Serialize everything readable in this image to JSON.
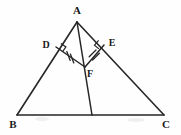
{
  "figure": {
    "type": "geometry-diagram",
    "canvas": {
      "width": 181,
      "height": 135
    },
    "background_color": "#fefefe",
    "stroke_color": "#262626",
    "label_color": "#1a1a1a"
  },
  "labels": {
    "a": "A",
    "b": "B",
    "c": "C",
    "d": "D",
    "e": "E",
    "f": "F"
  },
  "points": {
    "A": {
      "x": 77,
      "y": 22
    },
    "B": {
      "x": 17,
      "y": 115
    },
    "C": {
      "x": 164,
      "y": 115
    },
    "D": {
      "x": 56,
      "y": 47
    },
    "E": {
      "x": 104,
      "y": 45
    },
    "F": {
      "x": 85,
      "y": 67
    },
    "G": {
      "x": 92,
      "y": 115
    }
  },
  "label_positions": {
    "A": {
      "x": 77,
      "y": 14
    },
    "B": {
      "x": 13,
      "y": 128
    },
    "C": {
      "x": 166,
      "y": 128
    },
    "D": {
      "x": 46,
      "y": 48
    },
    "E": {
      "x": 112,
      "y": 46
    },
    "F": {
      "x": 90,
      "y": 76
    }
  },
  "segments": [
    {
      "name": "side-ab",
      "from": "A",
      "to": "B"
    },
    {
      "name": "side-ac",
      "from": "A",
      "to": "C"
    },
    {
      "name": "side-bc",
      "from": "B",
      "to": "C"
    },
    {
      "name": "cevian-ag",
      "from": "A",
      "to": "G"
    },
    {
      "name": "perpendicular-df",
      "from": "D",
      "to": "F"
    },
    {
      "name": "perpendicular-ef",
      "from": "E",
      "to": "F"
    }
  ],
  "marks": {
    "right_angles": [
      {
        "name": "right-angle-at-d",
        "vertex": "D"
      },
      {
        "name": "right-angle-at-e",
        "vertex": "E"
      }
    ],
    "congruence_ticks": [
      {
        "name": "tick-df",
        "segment": "DF",
        "count": 2
      },
      {
        "name": "tick-ef",
        "segment": "EF",
        "count": 2
      }
    ]
  }
}
